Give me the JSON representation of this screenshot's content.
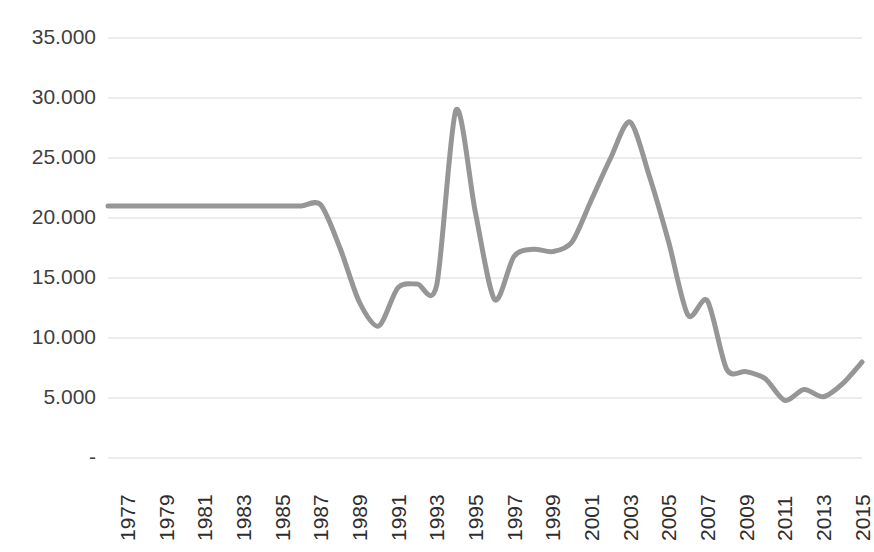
{
  "chart_data": {
    "type": "line",
    "title": "",
    "subtitle": "",
    "xlabel": "",
    "ylabel": "",
    "grid": true,
    "legend": false,
    "legend_position": "none",
    "line_color": "#969696",
    "gridline_color": "#d9d9d9",
    "text_color": "#3f3f3f",
    "background_color": "#ffffff",
    "ylim": [
      0,
      35000
    ],
    "xlim": [
      1977,
      2016
    ],
    "y_ticks": [
      0,
      5000,
      10000,
      15000,
      20000,
      25000,
      30000,
      35000
    ],
    "y_tick_labels": [
      "-",
      "5.000",
      "10.000",
      "15.000",
      "20.000",
      "25.000",
      "30.000",
      "35.000"
    ],
    "x_tick_labels": [
      "1977",
      "1979",
      "1981",
      "1983",
      "1985",
      "1987",
      "1989",
      "1991",
      "1993",
      "1995",
      "1997",
      "1999",
      "2001",
      "2003",
      "2005",
      "2007",
      "2009",
      "2011",
      "2013",
      "2015"
    ],
    "x": [
      1977,
      1978,
      1979,
      1980,
      1981,
      1982,
      1983,
      1984,
      1985,
      1986,
      1987,
      1988,
      1989,
      1990,
      1991,
      1992,
      1993,
      1994,
      1995,
      1996,
      1997,
      1998,
      1999,
      2000,
      2001,
      2002,
      2003,
      2004,
      2005,
      2006,
      2007,
      2008,
      2009,
      2010,
      2011,
      2012,
      2013,
      2014,
      2015,
      2016
    ],
    "values": [
      21000,
      21000,
      21000,
      21000,
      21000,
      21000,
      21000,
      21000,
      21000,
      21000,
      21000,
      21100,
      17500,
      13000,
      11000,
      14200,
      14500,
      14400,
      29000,
      20500,
      13200,
      16800,
      17400,
      17200,
      18000,
      21500,
      25000,
      28000,
      23500,
      18000,
      11900,
      13100,
      7400,
      7200,
      6600,
      4800,
      5700,
      5100,
      6200,
      8000
    ]
  }
}
